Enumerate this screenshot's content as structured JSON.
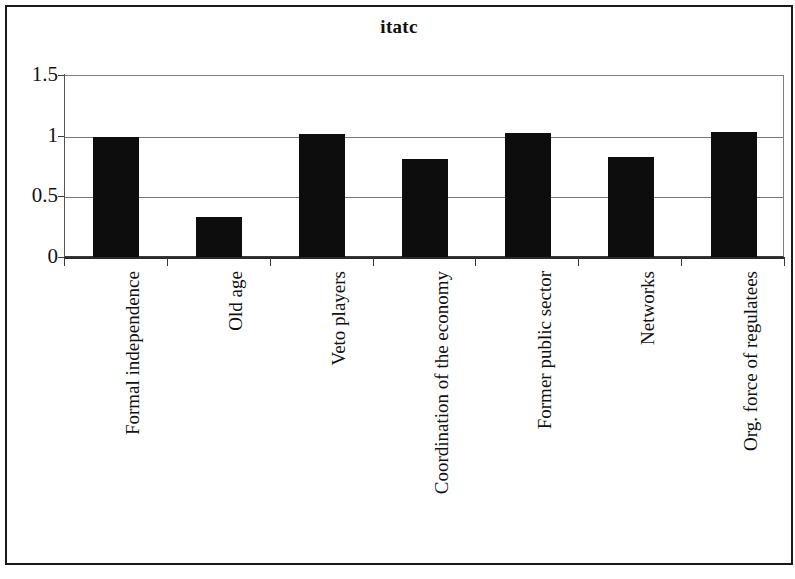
{
  "chart_data": {
    "type": "bar",
    "title": "itatc",
    "xlabel": "",
    "ylabel": "",
    "categories": [
      "Formal independence",
      "Old age",
      "Veto players",
      "Coordination of the economy",
      "Former public sector",
      "Networks",
      "Org. force of regulatees"
    ],
    "values": [
      1.0,
      0.34,
      1.02,
      0.82,
      1.03,
      0.83,
      1.04
    ],
    "ylim": [
      0,
      1.5
    ],
    "yticks": [
      0,
      0.5,
      1,
      1.5
    ],
    "ytick_labels": [
      "0",
      "0.5",
      "1",
      "1.5"
    ],
    "grid": true,
    "legend": false,
    "bar_color": "#0d0d0d",
    "gridline_color": "#7a7a7a",
    "axis_color": "#2a2a2a",
    "background": "#ffffff",
    "label_rotation": -90
  }
}
